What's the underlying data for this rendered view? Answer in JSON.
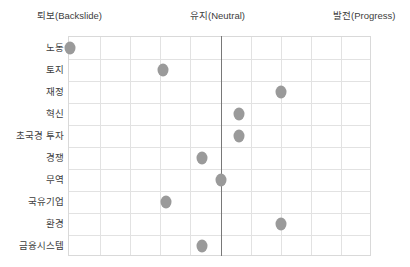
{
  "chart_data": {
    "type": "scatter",
    "title": "",
    "xlabel": "",
    "ylabel": "",
    "grid": true,
    "legend": false,
    "xlim": [
      -5,
      5
    ],
    "x_axis_captions": [
      {
        "label": "퇴보(Backslide)",
        "position": "left",
        "value": -5
      },
      {
        "label": "유지(Neutral)",
        "position": "center",
        "value": 0
      },
      {
        "label": "발전(Progress)",
        "position": "right",
        "value": 5
      }
    ],
    "categories": [
      "노동",
      "토지",
      "재정",
      "혁신",
      "초국경 투자",
      "경쟁",
      "무역",
      "국유기업",
      "환경",
      "금융시스템"
    ],
    "values": [
      -5.0,
      -1.9,
      2.0,
      0.6,
      0.6,
      -0.6,
      0.0,
      -1.8,
      2.0,
      -0.6
    ],
    "points": [
      {
        "category": "노동",
        "value": -5.0
      },
      {
        "category": "토지",
        "value": -1.9
      },
      {
        "category": "재정",
        "value": 2.0
      },
      {
        "category": "혁신",
        "value": 0.6
      },
      {
        "category": "초국경 투자",
        "value": 0.6
      },
      {
        "category": "경쟁",
        "value": -0.6
      },
      {
        "category": "무역",
        "value": 0.0
      },
      {
        "category": "국유기업",
        "value": -1.8
      },
      {
        "category": "환경",
        "value": 2.0
      },
      {
        "category": "금융시스템",
        "value": -0.6
      }
    ],
    "colors": {
      "marker": "#9a9a9a",
      "grid": "#e2e2e2",
      "frame": "#d9d9d9",
      "centerline": "#787878",
      "text": "#3d3d3d"
    }
  }
}
